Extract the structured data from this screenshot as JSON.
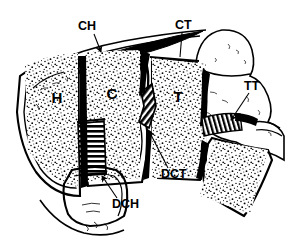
{
  "figure": {
    "kind": "anatomical-line-drawing",
    "style": "black-and-white ink illustration, stippled trabecular bone, hatched plates",
    "background_color": "#ffffff",
    "ink_color": "#000000"
  },
  "region_labels": [
    {
      "id": "H",
      "text": "H",
      "x": 57,
      "y": 103,
      "meaning": "segment-h"
    },
    {
      "id": "C",
      "text": "C",
      "x": 112,
      "y": 99,
      "meaning": "segment-c"
    },
    {
      "id": "T",
      "text": "T",
      "x": 178,
      "y": 102,
      "meaning": "segment-t"
    }
  ],
  "callouts": [
    {
      "id": "CH",
      "text": "CH",
      "label_x": 78,
      "label_y": 30,
      "leader": "M 94 34 L 101 52",
      "arrow": true,
      "target": "upper-hatched-plate-left"
    },
    {
      "id": "CT",
      "text": "CT",
      "label_x": 176,
      "label_y": 28,
      "leader": "M 182 32 L 180 57",
      "arrow": false,
      "target": "upper-crosshatched-plate-right"
    },
    {
      "id": "TT",
      "text": "TT",
      "label_x": 245,
      "label_y": 89,
      "leader": "M 249 92 L 230 119",
      "arrow": true,
      "target": "striped-tendon-band"
    },
    {
      "id": "DCT",
      "text": "DCT",
      "label_x": 163,
      "label_y": 177,
      "leader": "M 168 168 L 148 133",
      "arrow": true,
      "target": "dark-hatched-disc-right"
    },
    {
      "id": "DCH",
      "text": "DCH",
      "label_x": 114,
      "label_y": 207,
      "leader": "M 116 198 L 101 177",
      "arrow": true,
      "target": "dark-hatched-disc-left"
    }
  ],
  "features": [
    {
      "name": "ligament-wedge-top",
      "description": "dark tapered band across top"
    },
    {
      "name": "condyle-knob-upper-right",
      "description": "rounded bone knob"
    },
    {
      "name": "stippled-bone-h",
      "description": "trabecular stipple in segment H"
    },
    {
      "name": "stippled-bone-c",
      "description": "trabecular stipple in segment C"
    },
    {
      "name": "stippled-bone-t",
      "description": "trabecular stipple in segment T"
    },
    {
      "name": "stippled-bone-lower-right",
      "description": "unlabelled fourth segment"
    },
    {
      "name": "inferior-process",
      "description": "lower protruding process"
    }
  ]
}
